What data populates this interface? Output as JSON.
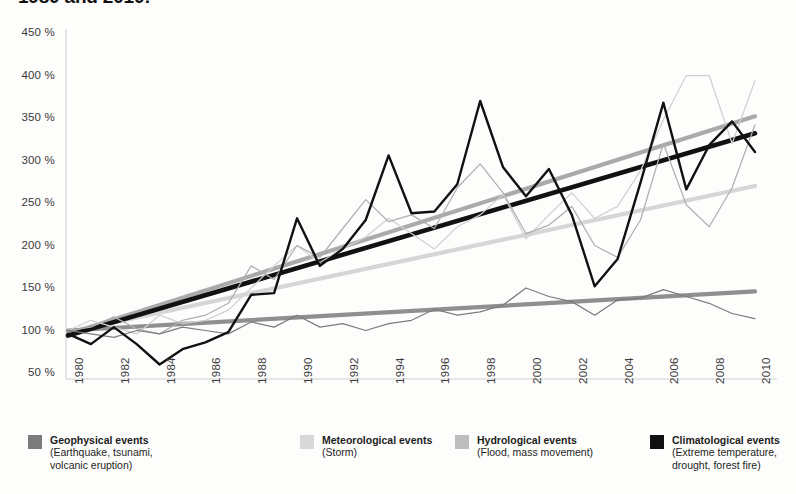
{
  "title": "1980 and 2010:",
  "axes": {
    "y_ticks": [
      "450 %",
      "400 %",
      "350 %",
      "300 %",
      "250 %",
      "200 %",
      "150 %",
      "100 %",
      "50 %"
    ],
    "x_ticks": [
      "1980",
      "1982",
      "1984",
      "1986",
      "1988",
      "1990",
      "1992",
      "1994",
      "1996",
      "1998",
      "2000",
      "2002",
      "2004",
      "2006",
      "2008",
      "2010"
    ]
  },
  "legend": {
    "items": [
      {
        "name": "Geophysical events",
        "sub": "(Earthquake, tsunami,\nvolcanic eruption)",
        "color": "#7c7c7c"
      },
      {
        "name": "Meteorological events",
        "sub": "(Storm)",
        "color": "#d8d8d8"
      },
      {
        "name": "Hydrological events",
        "sub": "(Flood, mass movement)",
        "color": "#bdbdbd"
      },
      {
        "name": "Climatological events",
        "sub": "(Extreme temperature,\ndrought, forest fire)",
        "color": "#111111"
      }
    ]
  },
  "chart_data": {
    "type": "line",
    "title": "1980 and 2010:",
    "xlabel": "",
    "ylabel": "%",
    "ylim": [
      50,
      450
    ],
    "xlim": [
      1980,
      2010
    ],
    "ytick_step": 50,
    "grid": false,
    "legend_position": "bottom",
    "x": [
      1980,
      1981,
      1982,
      1983,
      1984,
      1985,
      1986,
      1987,
      1988,
      1989,
      1990,
      1991,
      1992,
      1993,
      1994,
      1995,
      1996,
      1997,
      1998,
      1999,
      2000,
      2001,
      2002,
      2003,
      2004,
      2005,
      2006,
      2007,
      2008,
      2009,
      2010
    ],
    "series": [
      {
        "name": "Geophysical events",
        "color": "#7c7c7c",
        "values": [
          100,
          96,
          92,
          100,
          96,
          104,
          100,
          96,
          110,
          104,
          118,
          104,
          108,
          100,
          108,
          112,
          125,
          118,
          122,
          130,
          150,
          140,
          134,
          118,
          136,
          138,
          148,
          140,
          132,
          120,
          114
        ],
        "trend": {
          "start": 100,
          "end": 146,
          "color": "#8a8a8a"
        }
      },
      {
        "name": "Meteorological events",
        "color": "#d0d0d0",
        "values": [
          100,
          112,
          104,
          96,
          118,
          108,
          112,
          124,
          150,
          176,
          200,
          180,
          196,
          210,
          232,
          214,
          196,
          222,
          236,
          260,
          208,
          236,
          262,
          232,
          246,
          288,
          348,
          400,
          400,
          320,
          394
        ],
        "trend": {
          "start": 98,
          "end": 270,
          "color": "#d4d4d4"
        }
      },
      {
        "name": "Hydrological events",
        "color": "#b0b0b0",
        "values": [
          100,
          104,
          116,
          102,
          96,
          112,
          118,
          132,
          176,
          160,
          200,
          186,
          220,
          254,
          228,
          236,
          220,
          268,
          296,
          262,
          214,
          224,
          246,
          200,
          186,
          230,
          320,
          248,
          222,
          268,
          342
        ],
        "trend": {
          "start": 96,
          "end": 352,
          "color": "#a6a6a6"
        }
      },
      {
        "name": "Climatological events",
        "color": "#111111",
        "values": [
          96,
          84,
          104,
          84,
          60,
          78,
          86,
          98,
          142,
          144,
          232,
          176,
          196,
          230,
          306,
          238,
          240,
          272,
          370,
          292,
          258,
          290,
          236,
          152,
          184,
          274,
          368,
          266,
          318,
          346,
          310
        ],
        "trend": {
          "start": 94,
          "end": 332,
          "color": "#111111"
        }
      }
    ]
  }
}
